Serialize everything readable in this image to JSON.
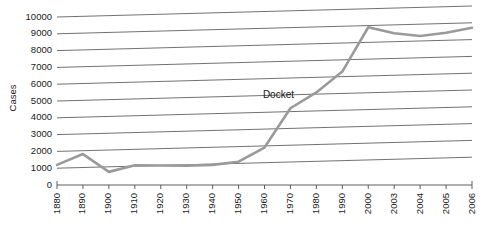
{
  "chart_data": {
    "type": "line",
    "title": "",
    "xlabel": "",
    "ylabel": "Cases",
    "categories": [
      "1880",
      "1890",
      "1900",
      "1910",
      "1920",
      "1930",
      "1940",
      "1950",
      "1960",
      "1970",
      "1980",
      "1990",
      "2000",
      "2003",
      "2004",
      "2005",
      "2006"
    ],
    "series": [
      {
        "name": "Docket",
        "values": [
          1200,
          1800,
          700,
          1050,
          1000,
          950,
          950,
          1100,
          1900,
          4200,
          5100,
          6300,
          8900,
          8500,
          8300,
          8450,
          8700
        ]
      }
    ],
    "ylim": [
      0,
      10000
    ],
    "yticks": [
      0,
      1000,
      2000,
      3000,
      4000,
      5000,
      6000,
      7000,
      8000,
      9000,
      10000
    ],
    "ytick_labels": [
      "0",
      "1000",
      "2000",
      "3000",
      "4000",
      "5000",
      "6000",
      "7000",
      "8000",
      "9000",
      "10000"
    ],
    "grid": true,
    "grid_style": "horizontal-skewed",
    "legend": "none",
    "annotations": [
      {
        "text": "Docket",
        "category": "1970",
        "value": 5000
      }
    ],
    "colors": {
      "series_line": "#9a9a9a",
      "gridline": "#4d4d4d",
      "axis": "#4d4d4d",
      "text": "#1a1a1a",
      "background": "#ffffff"
    }
  }
}
